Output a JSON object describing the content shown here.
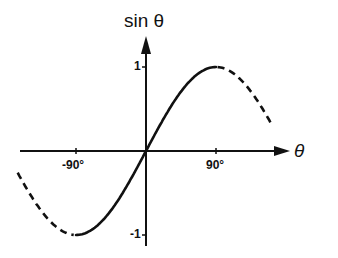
{
  "chart_data": {
    "type": "line",
    "title": "",
    "xlabel": "θ",
    "ylabel": "sin θ",
    "x_ticks": [
      "-90°",
      "90°"
    ],
    "y_ticks": [
      "1",
      "-1"
    ],
    "xlim": [
      -165,
      162
    ],
    "ylim": [
      -1,
      1
    ],
    "grid": false,
    "legend": null,
    "series": [
      {
        "name": "sin θ (solid, principal range)",
        "style": "solid",
        "x": [
          -90,
          -60,
          -30,
          0,
          30,
          60,
          90
        ],
        "values": [
          -1,
          -0.866,
          -0.5,
          0,
          0.5,
          0.866,
          1
        ]
      },
      {
        "name": "sin θ (dashed, extension right)",
        "style": "dashed",
        "x": [
          90,
          120,
          150,
          162
        ],
        "values": [
          1,
          0.866,
          0.5,
          0.31
        ]
      },
      {
        "name": "sin θ (dashed, extension left)",
        "style": "dashed",
        "x": [
          -165,
          -150,
          -120,
          -90
        ],
        "values": [
          -0.26,
          -0.5,
          -0.866,
          -1
        ]
      }
    ]
  },
  "labels": {
    "y_axis": "sin θ",
    "x_axis": "θ",
    "tick_pos90": "90°",
    "tick_neg90": "-90°",
    "tick_pos1": "1",
    "tick_neg1": "-1"
  },
  "colors": {
    "ink": "#111111",
    "background": "#ffffff"
  }
}
